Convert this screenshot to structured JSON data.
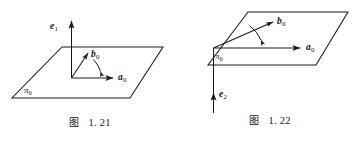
{
  "page": {
    "background_color": "#ffffff",
    "stroke_color": "#1a1a1a",
    "width": 360,
    "height": 142
  },
  "figures": [
    {
      "id": "1.21",
      "caption_cjk": "图",
      "caption_number": "1. 21",
      "plane_label": "π",
      "plane_label_sub": "0",
      "vectors": [
        {
          "name": "e1",
          "label": "e",
          "sub": "1",
          "direction": "up-vertical",
          "description": "normal vector pointing straight up out of plane"
        },
        {
          "name": "b0",
          "label": "b",
          "sub": "0",
          "direction": "up-right-diagonal",
          "description": "vector in plane, tilted up-left from a0"
        },
        {
          "name": "a0",
          "label": "a",
          "sub": "0",
          "direction": "right-horizontal",
          "description": "vector in plane pointing right"
        }
      ],
      "arc": {
        "from": "a0",
        "to": "b0",
        "description": "angle arc between a0 and b0"
      }
    },
    {
      "id": "1.22",
      "caption_cjk": "图",
      "caption_number": "1. 22",
      "plane_label": "π",
      "plane_label_sub": "0",
      "vectors": [
        {
          "name": "b0",
          "label": "b",
          "sub": "0",
          "direction": "up-right-diagonal",
          "description": "vector in plane, tilted up-left from a0"
        },
        {
          "name": "a0",
          "label": "a",
          "sub": "0",
          "direction": "right-horizontal",
          "description": "vector in plane pointing right"
        },
        {
          "name": "e2",
          "label": "e",
          "sub": "2",
          "direction": "down-vertical",
          "description": "normal vector pointing straight down below plane"
        }
      ],
      "arc": {
        "from": "a0",
        "to": "b0",
        "description": "angle arc between a0 and b0"
      }
    }
  ]
}
